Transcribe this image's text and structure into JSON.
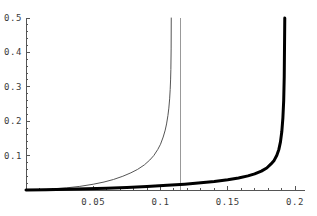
{
  "chart_data": {
    "type": "line",
    "title": "",
    "subtitle": "",
    "xlabel": "",
    "ylabel": "",
    "xlim": [
      0.0,
      0.2075
    ],
    "ylim": [
      0.0,
      0.5
    ],
    "grid": false,
    "legend": null,
    "legend_position": "none",
    "xticks": [
      0.05,
      0.1,
      0.15,
      0.2
    ],
    "xtick_labels": [
      "0.05",
      "0.1",
      "0.15",
      "0.2"
    ],
    "yticks": [
      0.1,
      0.2,
      0.3,
      0.4,
      0.5
    ],
    "ytick_labels": [
      "0.1",
      "0.2",
      "0.3",
      "0.4",
      "0.5"
    ],
    "axis_color": "#555555",
    "background": "#ffffff",
    "series": [
      {
        "name": "thin-curve",
        "style": "solid",
        "color": "#555555",
        "linewidth": 1,
        "asymptote_x": 0.108,
        "x": [
          0.0,
          0.01,
          0.02,
          0.03,
          0.04,
          0.05,
          0.058,
          0.065,
          0.072,
          0.078,
          0.083,
          0.088,
          0.092,
          0.095,
          0.098,
          0.1,
          0.102,
          0.1035,
          0.1045,
          0.1055,
          0.1062,
          0.1068,
          0.1072,
          0.1075,
          0.1077,
          0.1079,
          0.108
        ],
        "y": [
          0.0,
          0.0012,
          0.0032,
          0.0062,
          0.0105,
          0.0168,
          0.0232,
          0.0305,
          0.04,
          0.05,
          0.06,
          0.073,
          0.087,
          0.1,
          0.118,
          0.133,
          0.154,
          0.174,
          0.192,
          0.216,
          0.238,
          0.265,
          0.292,
          0.32,
          0.35,
          0.41,
          0.5
        ]
      },
      {
        "name": "thick-curve",
        "style": "solid",
        "color": "#000000",
        "linewidth": 3,
        "asymptote_x": 0.1925,
        "x": [
          0.0,
          0.015,
          0.03,
          0.045,
          0.06,
          0.075,
          0.09,
          0.105,
          0.118,
          0.13,
          0.14,
          0.15,
          0.158,
          0.165,
          0.17,
          0.175,
          0.179,
          0.182,
          0.1845,
          0.1865,
          0.188,
          0.1892,
          0.1902,
          0.191,
          0.1916,
          0.192,
          0.1924
        ],
        "y": [
          0.0,
          0.0008,
          0.002,
          0.0035,
          0.0053,
          0.0075,
          0.0102,
          0.0135,
          0.017,
          0.021,
          0.025,
          0.03,
          0.035,
          0.041,
          0.047,
          0.055,
          0.064,
          0.075,
          0.086,
          0.101,
          0.118,
          0.14,
          0.17,
          0.21,
          0.26,
          0.33,
          0.5
        ]
      }
    ],
    "vertical_lines": [
      {
        "name": "gray-asymptote-line",
        "x": 0.1148,
        "color": "#999999",
        "linewidth": 1,
        "y_from": 0.0,
        "y_to": 0.5
      }
    ]
  }
}
